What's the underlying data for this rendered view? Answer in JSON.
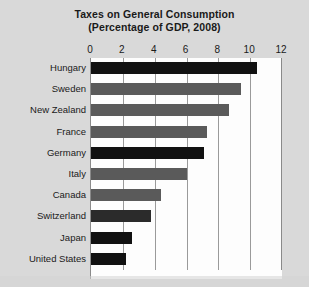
{
  "chart_data": {
    "type": "bar",
    "orientation": "horizontal",
    "title": "Taxes on General Consumption",
    "subtitle": "(Percentage of GDP, 2008)",
    "xlabel": "",
    "ylabel": "",
    "xlim": [
      0,
      12
    ],
    "xticks": [
      0,
      2,
      4,
      6,
      8,
      10,
      12
    ],
    "xtick_labels": [
      "0",
      "2",
      "4",
      "6",
      "8",
      "10",
      "12"
    ],
    "grid": true,
    "grid_axis": "x",
    "legend": false,
    "categories": [
      "Hungary",
      "Sweden",
      "New Zealand",
      "France",
      "Germany",
      "Italy",
      "Canada",
      "Switzerland",
      "Japan",
      "United States"
    ],
    "values": [
      10.4,
      9.4,
      8.7,
      7.3,
      7.1,
      6.0,
      4.4,
      3.8,
      2.6,
      2.2
    ],
    "bar_colors": [
      "#111111",
      "#5a5a5a",
      "#5a5a5a",
      "#5a5a5a",
      "#111111",
      "#5a5a5a",
      "#5a5a5a",
      "#2b2b2b",
      "#111111",
      "#111111"
    ]
  },
  "colors": {
    "background": "#d9d9d9",
    "plot_background": "#fdfdfd",
    "gridline": "#9a9a9a",
    "axis": "#8a8a8a",
    "text": "#1a1a1a",
    "bar_dark": "#111111",
    "bar_gray": "#5a5a5a"
  }
}
